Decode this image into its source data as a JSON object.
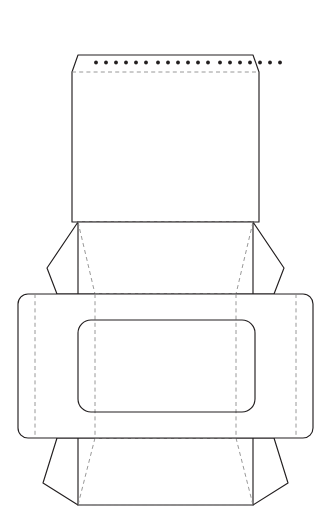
{
  "document": {
    "title": "Envelope Box Dieline Template",
    "canvas": {
      "width": 331,
      "height": 524
    },
    "background_color": "#ffffff"
  },
  "style": {
    "cut_line_color": "#231f20",
    "cut_line_width": 1.15,
    "fold_line_color": "#8c8c8c",
    "fold_line_width": 0.9,
    "fold_dash_pattern": "4 3.2",
    "perforation_dot_color": "#231f20",
    "panel_fill_color": "#ffffff"
  },
  "parts": {
    "top_flap": {
      "label": "Top closure flap",
      "outline": "M 72 72 L 78 55 L 253 55 L 259 72 L 259 222 L 72 222 Z",
      "top_edge_y": 55,
      "chamfer_y": 72,
      "bottom_y": 222,
      "left_x": 72,
      "right_x": 259
    },
    "top_flap_fold": {
      "label": "Top flap score line",
      "path": "M 72 72 L 259 72"
    },
    "perforation_row": {
      "label": "Perforation dot row",
      "y": 62.5,
      "radius": 1.9,
      "count": 19,
      "x_positions": [
        96,
        106,
        116,
        126,
        136,
        146,
        158,
        168,
        178,
        188,
        198,
        208,
        220,
        230,
        240,
        250,
        260,
        270,
        280
      ]
    },
    "left_upper_wing": {
      "label": "Left upper side wing",
      "outline": "M 78 222 L 47 268 L 57 294 L 78 294 Z"
    },
    "right_upper_wing": {
      "label": "Right upper side wing",
      "outline": "M 253 222 L 284 268 L 274 294 L 253 294 Z"
    },
    "upper_body": {
      "label": "Upper body panel",
      "outline": "M 78 222 L 253 222 L 274 294 L 57 294 Z"
    },
    "upper_body_fold_top": {
      "label": "Upper body top score",
      "path": "M 78 222 L 253 222"
    },
    "upper_body_fold_left": {
      "label": "Upper body left diagonal score",
      "path": "M 78 222 L 95 294"
    },
    "upper_body_fold_right": {
      "label": "Upper body right diagonal score",
      "path": "M 253 222 L 236 294"
    },
    "center_band": {
      "label": "Center wrap band",
      "x": 18,
      "y": 294,
      "width": 295,
      "height": 144,
      "corner_radius": 10
    },
    "band_fold_left": {
      "label": "Band left vertical score",
      "path": "M 35 294 L 35 438"
    },
    "band_fold_right": {
      "label": "Band right vertical score",
      "path": "M 296 294 L 296 438"
    },
    "band_fold_inner_left": {
      "label": "Band inner left vertical score",
      "path": "M 95 294 L 95 438"
    },
    "band_fold_inner_right": {
      "label": "Band inner right vertical score",
      "path": "M 236 294 L 236 438"
    },
    "band_fold_top": {
      "label": "Band top horizontal score",
      "path": "M 95 294 L 236 294"
    },
    "band_fold_bottom": {
      "label": "Band bottom horizontal score",
      "path": "M 95 438 L 236 438"
    },
    "window_cutout": {
      "label": "Rounded rectangle window cut-out",
      "x": 78,
      "y": 320,
      "width": 177,
      "height": 92,
      "corner_radius": 13
    },
    "left_lower_wing": {
      "label": "Left lower side wing",
      "outline": "M 78 438 L 57 438 L 43 483 L 78 505 Z"
    },
    "right_lower_wing": {
      "label": "Right lower side wing",
      "outline": "M 253 438 L 274 438 L 288 483 L 253 505 Z"
    },
    "lower_body": {
      "label": "Lower body panel",
      "outline": "M 57 438 L 274 438 L 253 505 L 78 505 Z"
    },
    "lower_body_fold_bottom": {
      "label": "Lower body bottom score",
      "path": "M 78 505 L 253 505"
    },
    "lower_body_fold_left": {
      "label": "Lower body left diagonal score",
      "path": "M 95 438 L 78 505"
    },
    "lower_body_fold_right": {
      "label": "Lower body right diagonal score",
      "path": "M 236 438 L 253 505"
    }
  }
}
